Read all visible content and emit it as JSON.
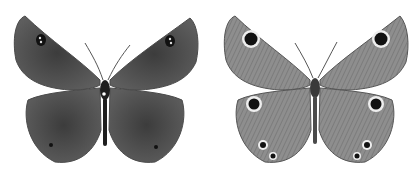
{
  "image": {
    "subject": "Butterfly specimen illustration",
    "panels": [
      {
        "view": "upperside",
        "wing_color": "#5a5a5a",
        "body_color": "#1e1e1e",
        "eyespots": 4
      },
      {
        "view": "underside",
        "wing_color": "#8a8a8a",
        "body_color": "#3a3a3a",
        "eyespots": 8
      }
    ],
    "background": "#ffffff"
  }
}
